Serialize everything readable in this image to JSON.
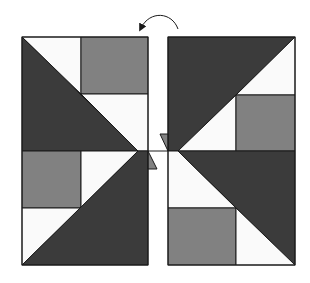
{
  "diagram": {
    "colors": {
      "dark": "#3b3b3b",
      "gray": "#818181",
      "light": "#fafafa",
      "stroke": "#1a1a1a",
      "background": "#ffffff"
    },
    "arrow": {
      "direction": "counterclockwise",
      "meaning": "rotate"
    },
    "left_panel": {
      "x": 22,
      "y": 37,
      "width": 126,
      "height": 228,
      "shapes": [
        {
          "name": "top-left-light-triangle",
          "fill": "light",
          "points": "22,37 81,37 81,94"
        },
        {
          "name": "top-left-gray-square",
          "fill": "gray",
          "points": "81,37 148,37 148,94 81,94"
        },
        {
          "name": "top-left-light-rect",
          "fill": "light",
          "points": "81,94 148,94 148,151 138,151"
        },
        {
          "name": "top-left-dark-triangle",
          "fill": "dark",
          "points": "22,37 138,151 22,151"
        },
        {
          "name": "bottom-left-gray-square",
          "fill": "gray",
          "points": "22,151 81,151 81,208 22,208"
        },
        {
          "name": "bottom-left-light-upper",
          "fill": "light",
          "points": "81,151 138,151 81,208"
        },
        {
          "name": "bottom-left-light-triangle",
          "fill": "light",
          "points": "22,208 81,208 22,265"
        },
        {
          "name": "bottom-left-dark-triangle",
          "fill": "dark",
          "points": "138,151 148,151 148,265 22,265"
        }
      ]
    },
    "right_panel": {
      "x": 168,
      "y": 37,
      "width": 127,
      "height": 228,
      "shapes": [
        {
          "name": "top-right-dark-triangle",
          "fill": "dark",
          "points": "168,37 295,37 178,151 168,151"
        },
        {
          "name": "top-right-light-triangle",
          "fill": "light",
          "points": "295,37 295,95 236,95"
        },
        {
          "name": "top-right-light-lower",
          "fill": "light",
          "points": "236,95 236,151 178,151"
        },
        {
          "name": "top-right-gray-square",
          "fill": "gray",
          "points": "236,95 295,95 295,151 236,151"
        },
        {
          "name": "bottom-right-light-upper",
          "fill": "light",
          "points": "168,151 178,151 236,208 168,208"
        },
        {
          "name": "bottom-right-dark-triangle",
          "fill": "dark",
          "points": "178,151 295,151 295,265"
        },
        {
          "name": "bottom-right-gray-square",
          "fill": "gray",
          "points": "168,208 236,208 236,265 168,265"
        },
        {
          "name": "bottom-right-light-triangle",
          "fill": "light",
          "points": "236,208 295,265 236,265"
        }
      ]
    },
    "small_triangles": [
      {
        "name": "center-upper-tab",
        "fill": "gray",
        "points": "160,134 168,134 168,151"
      },
      {
        "name": "center-lower-tab",
        "fill": "gray",
        "points": "148,151 148,169 157,169"
      }
    ]
  }
}
